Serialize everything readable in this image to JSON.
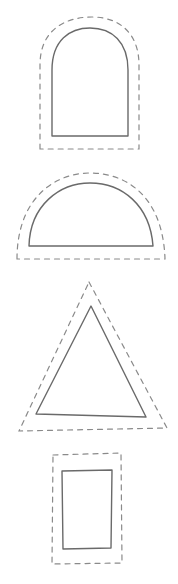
{
  "worksheet": {
    "title": "",
    "shapes": [
      {
        "name": "arch",
        "label": "arch-shape",
        "solid_path": "M52,136 L52,70 C52,40 70,28 90,28 C112,28 128,42 128,70 L128,136 Z",
        "dashed_path": "M40,149 L40,65 C40,30 65,17 92,17 C118,17 139,32 139,65 L139,149 Z"
      },
      {
        "name": "semicircle",
        "label": "semicircle-shape",
        "solid_path": "M29,246 C30,205 60,183 90,183 C122,183 150,205 153,246 Z",
        "dashed_path": "M17,259 C17,198 55,173 90,173 C128,173 163,198 165,259 Z"
      },
      {
        "name": "triangle",
        "label": "triangle-shape",
        "solid_path": "M91,306 L146,417 L36,414 Z",
        "dashed_path": "M89,282 L167,428 L19,431 Z"
      },
      {
        "name": "rectangle",
        "label": "rectangle-shape",
        "solid_path": "M62,471 L112,470 L111,548 L63,549 Z",
        "dashed_path": "M53,455 L121,453 L122,563 L52,564 Z"
      }
    ],
    "colors": {
      "background": "#ffffff",
      "solid_stroke": "#6a6a6a",
      "dashed_stroke": "#8a8a8a"
    }
  }
}
